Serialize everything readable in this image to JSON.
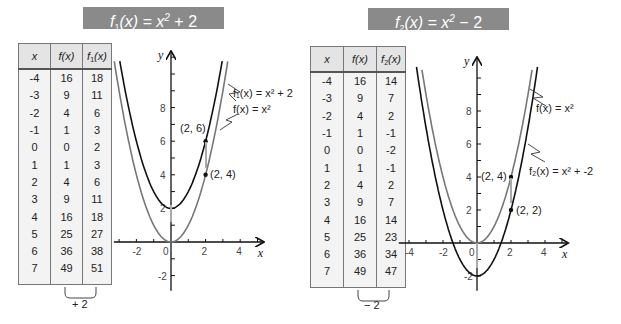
{
  "left": {
    "title": {
      "prefix": "f",
      "sub": "1",
      "rest": "(x) = x",
      "sup": "2",
      "tail": " + 2"
    },
    "table": {
      "headers": [
        "x",
        "f(x)",
        "f",
        "1",
        "(x)"
      ],
      "rows": [
        [
          "-4",
          "16",
          "18"
        ],
        [
          "-3",
          "9",
          "11"
        ],
        [
          "-2",
          "4",
          "6"
        ],
        [
          "-1",
          "1",
          "3"
        ],
        [
          "0",
          "0",
          "2"
        ],
        [
          "1",
          "1",
          "3"
        ],
        [
          "2",
          "4",
          "6"
        ],
        [
          "3",
          "9",
          "11"
        ],
        [
          "4",
          "16",
          "18"
        ],
        [
          "5",
          "25",
          "27"
        ],
        [
          "6",
          "36",
          "38"
        ],
        [
          "7",
          "49",
          "51"
        ]
      ]
    },
    "brace_label": "+ 2",
    "labels": {
      "f1": "f₁(x) = x² + 2",
      "f": "f(x) = x²",
      "p1": "(2, 6)",
      "p2": "(2, 4)",
      "yaxis": "y",
      "xaxis": "x",
      "ticks_x": [
        "-2",
        "0",
        "2",
        "4"
      ],
      "ticks_y": [
        "8",
        "6",
        "4",
        "2",
        "-2"
      ]
    }
  },
  "right": {
    "title": {
      "prefix": "f",
      "sub": "2",
      "rest": "(x) = x",
      "sup": "2",
      "tail": " − 2"
    },
    "table": {
      "headers": [
        "x",
        "f(x)",
        "f",
        "2",
        "(x)"
      ],
      "rows": [
        [
          "-4",
          "16",
          "14"
        ],
        [
          "-3",
          "9",
          "7"
        ],
        [
          "-2",
          "4",
          "2"
        ],
        [
          "-1",
          "1",
          "-1"
        ],
        [
          "0",
          "0",
          "-2"
        ],
        [
          "1",
          "1",
          "-1"
        ],
        [
          "2",
          "4",
          "2"
        ],
        [
          "3",
          "9",
          "7"
        ],
        [
          "4",
          "16",
          "14"
        ],
        [
          "5",
          "25",
          "23"
        ],
        [
          "6",
          "36",
          "34"
        ],
        [
          "7",
          "49",
          "47"
        ]
      ]
    },
    "brace_label": "− 2",
    "labels": {
      "f": "f(x) = x²",
      "f2": "f₂(x) = x² + -2",
      "p1": "(2, 4)",
      "p2": "(2, 2)",
      "yaxis": "y",
      "xaxis": "x",
      "ticks_x": [
        "-4",
        "-2",
        "0",
        "2",
        "4"
      ],
      "ticks_y": [
        "8",
        "6",
        "4",
        "2",
        "-2"
      ]
    }
  },
  "chart_data": [
    {
      "type": "line",
      "title": "f1(x) = x^2 + 2",
      "xlabel": "x",
      "ylabel": "y",
      "xlim": [
        -3.5,
        5.5
      ],
      "ylim": [
        -3,
        11
      ],
      "series": [
        {
          "name": "f(x) = x^2",
          "color": "#777777",
          "x": [
            -4,
            -3,
            -2,
            -1,
            0,
            1,
            2,
            3,
            4
          ],
          "values": [
            16,
            9,
            4,
            1,
            0,
            1,
            4,
            9,
            16
          ]
        },
        {
          "name": "f1(x) = x^2 + 2",
          "color": "#111111",
          "x": [
            -4,
            -3,
            -2,
            -1,
            0,
            1,
            2,
            3,
            4
          ],
          "values": [
            18,
            11,
            6,
            3,
            2,
            3,
            6,
            11,
            18
          ]
        }
      ],
      "annotations": [
        "(2, 6)",
        "(2, 4)"
      ],
      "table": {
        "x": [
          -4,
          -3,
          -2,
          -1,
          0,
          1,
          2,
          3,
          4,
          5,
          6,
          7
        ],
        "f": [
          16,
          9,
          4,
          1,
          0,
          1,
          4,
          9,
          16,
          25,
          36,
          49
        ],
        "f1": [
          18,
          11,
          6,
          3,
          2,
          3,
          6,
          11,
          18,
          27,
          38,
          51
        ]
      }
    },
    {
      "type": "line",
      "title": "f2(x) = x^2 - 2",
      "xlabel": "x",
      "ylabel": "y",
      "xlim": [
        -4.5,
        5.5
      ],
      "ylim": [
        -3,
        11
      ],
      "series": [
        {
          "name": "f(x) = x^2",
          "color": "#777777",
          "x": [
            -4,
            -3,
            -2,
            -1,
            0,
            1,
            2,
            3,
            4
          ],
          "values": [
            16,
            9,
            4,
            1,
            0,
            1,
            4,
            9,
            16
          ]
        },
        {
          "name": "f2(x) = x^2 + -2",
          "color": "#111111",
          "x": [
            -4,
            -3,
            -2,
            -1,
            0,
            1,
            2,
            3,
            4
          ],
          "values": [
            14,
            7,
            2,
            -1,
            -2,
            -1,
            2,
            7,
            14
          ]
        }
      ],
      "annotations": [
        "(2, 4)",
        "(2, 2)"
      ],
      "table": {
        "x": [
          -4,
          -3,
          -2,
          -1,
          0,
          1,
          2,
          3,
          4,
          5,
          6,
          7
        ],
        "f": [
          16,
          9,
          4,
          1,
          0,
          1,
          4,
          9,
          16,
          25,
          36,
          49
        ],
        "f2": [
          14,
          7,
          2,
          -1,
          -2,
          -1,
          2,
          7,
          14,
          23,
          34,
          47
        ]
      }
    }
  ]
}
